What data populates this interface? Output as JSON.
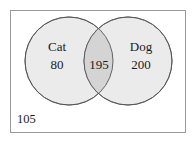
{
  "diagram": {
    "type": "venn-diagram",
    "universe": {
      "name": "universal-set",
      "outside_value": "105"
    },
    "sets": [
      {
        "id": "cat",
        "label": "Cat",
        "value": "80",
        "fill": "#ebebeb",
        "stroke": "#555555"
      },
      {
        "id": "dog",
        "label": "Dog",
        "value": "200",
        "fill": "#ebebeb",
        "stroke": "#555555"
      }
    ],
    "intersection": {
      "id": "cat-and-dog",
      "value": "195",
      "fill": "#d4d4d4"
    },
    "colors": {
      "border": "#9a9a9a",
      "circle_stroke": "#555555",
      "circle_fill": "#ebebeb",
      "intersection_fill": "#d4d4d4",
      "text": "#1a1a1a",
      "background": "#ffffff"
    }
  }
}
